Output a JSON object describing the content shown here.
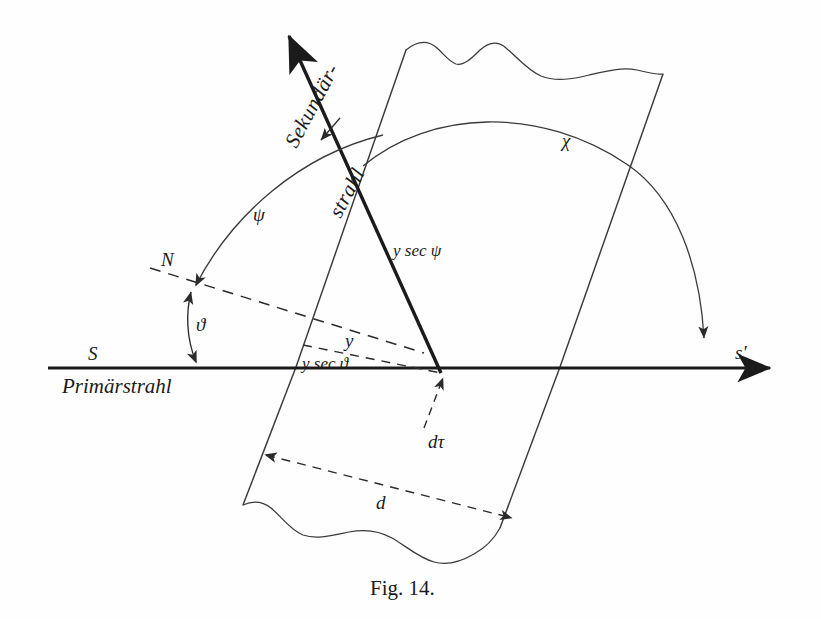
{
  "figure": {
    "caption": "Fig. 14.",
    "labels": {
      "secondary_ray_line1": "Sekundär-",
      "secondary_ray_line2": "strahl",
      "primary_ray": "Primärstrahl",
      "axis_left": "S",
      "axis_right": "s'",
      "normal": "N",
      "angle_theta": "ϑ",
      "angle_psi": "ψ",
      "angle_chi": "χ",
      "length_y": "y",
      "length_y_sec_theta": "y sec ϑ",
      "length_y_sec_psi": "y sec ψ",
      "volume_element": "dτ",
      "thickness": "d"
    },
    "colors": {
      "ink": "#1b1b1b",
      "thin_line": "#3a3a3a",
      "paper": "#fefefe"
    }
  }
}
